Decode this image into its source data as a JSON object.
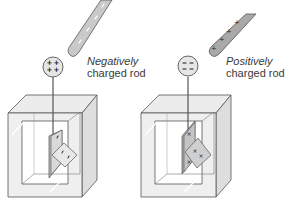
{
  "colors": {
    "rod_fill": "#c9c9c9",
    "rod_stroke": "#555555",
    "rod_marks": "#ffffff",
    "box_face": "#ececec",
    "box_side": "#dedede",
    "box_stroke": "#555555",
    "knob_fill": "#e6e6e6",
    "leaf_fill": "#d6d6d6",
    "leaf_back": "#b9b9b9",
    "charge_color": "#1a1a1a",
    "text_color": "#3a3a3a"
  },
  "panels": [
    {
      "id": "left",
      "rod_charge": "negative",
      "rod_label_line1": "Negatively",
      "rod_label_line2": "charged rod",
      "rod_marks": [
        "−",
        "−",
        "−",
        "−"
      ],
      "knob_charges": [
        "+",
        "+",
        "+",
        "+"
      ],
      "leaf_charges": [
        "−",
        "−",
        "−"
      ]
    },
    {
      "id": "right",
      "rod_charge": "positive",
      "rod_label_line1": "Positively",
      "rod_label_line2": "charged rod",
      "rod_marks": [
        "+",
        "+",
        "+",
        "+"
      ],
      "knob_charges": [
        "−",
        "−"
      ],
      "leaf_charges": [
        "+",
        "+",
        "+",
        "+"
      ]
    }
  ]
}
